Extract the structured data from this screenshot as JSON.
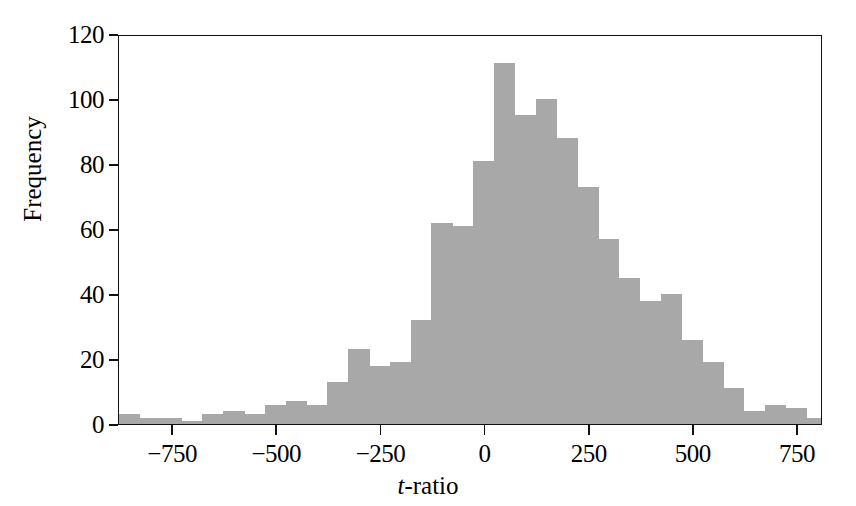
{
  "chart_data": {
    "type": "bar",
    "subtype": "histogram",
    "title": "",
    "xlabel": "t-ratio",
    "xlabel_italic_prefix": "t",
    "xlabel_rest": "-ratio",
    "ylabel": "Frequency",
    "xlim": [
      -880,
      810
    ],
    "ylim": [
      0,
      120
    ],
    "xticks": [
      -750,
      -500,
      -250,
      0,
      250,
      500,
      750
    ],
    "xtick_labels": [
      "−750",
      "−500",
      "−250",
      "0",
      "250",
      "500",
      "750"
    ],
    "yticks": [
      0,
      20,
      40,
      60,
      80,
      100,
      120
    ],
    "ytick_labels": [
      "0",
      "20",
      "40",
      "60",
      "80",
      "100",
      "120"
    ],
    "grid": false,
    "legend": null,
    "bin_width": 50,
    "bar_color": "#a8a8a8",
    "frame_color": "#111111",
    "bins": [
      {
        "x0": -880,
        "x1": -830,
        "center": -855,
        "value": 3
      },
      {
        "x0": -830,
        "x1": -780,
        "center": -805,
        "value": 2
      },
      {
        "x0": -780,
        "x1": -730,
        "center": -755,
        "value": 2
      },
      {
        "x0": -730,
        "x1": -680,
        "center": -705,
        "value": 1
      },
      {
        "x0": -680,
        "x1": -630,
        "center": -655,
        "value": 3
      },
      {
        "x0": -630,
        "x1": -580,
        "center": -605,
        "value": 4
      },
      {
        "x0": -580,
        "x1": -530,
        "center": -555,
        "value": 3
      },
      {
        "x0": -530,
        "x1": -480,
        "center": -505,
        "value": 6
      },
      {
        "x0": -480,
        "x1": -430,
        "center": -455,
        "value": 7
      },
      {
        "x0": -430,
        "x1": -380,
        "center": -405,
        "value": 6
      },
      {
        "x0": -380,
        "x1": -330,
        "center": -355,
        "value": 13
      },
      {
        "x0": -330,
        "x1": -280,
        "center": -305,
        "value": 23
      },
      {
        "x0": -280,
        "x1": -230,
        "center": -255,
        "value": 18
      },
      {
        "x0": -230,
        "x1": -180,
        "center": -205,
        "value": 19
      },
      {
        "x0": -180,
        "x1": -130,
        "center": -155,
        "value": 32
      },
      {
        "x0": -130,
        "x1": -80,
        "center": -105,
        "value": 62
      },
      {
        "x0": -80,
        "x1": -30,
        "center": -55,
        "value": 61
      },
      {
        "x0": -30,
        "x1": 20,
        "center": -5,
        "value": 81
      },
      {
        "x0": 20,
        "x1": 70,
        "center": 45,
        "value": 111
      },
      {
        "x0": 70,
        "x1": 120,
        "center": 95,
        "value": 95
      },
      {
        "x0": 120,
        "x1": 170,
        "center": 145,
        "value": 100
      },
      {
        "x0": 170,
        "x1": 220,
        "center": 195,
        "value": 88
      },
      {
        "x0": 220,
        "x1": 270,
        "center": 245,
        "value": 73
      },
      {
        "x0": 270,
        "x1": 320,
        "center": 295,
        "value": 57
      },
      {
        "x0": 320,
        "x1": 370,
        "center": 345,
        "value": 45
      },
      {
        "x0": 370,
        "x1": 420,
        "center": 395,
        "value": 38
      },
      {
        "x0": 420,
        "x1": 470,
        "center": 445,
        "value": 40
      },
      {
        "x0": 470,
        "x1": 520,
        "center": 495,
        "value": 26
      },
      {
        "x0": 520,
        "x1": 570,
        "center": 545,
        "value": 19
      },
      {
        "x0": 570,
        "x1": 620,
        "center": 595,
        "value": 11
      },
      {
        "x0": 620,
        "x1": 670,
        "center": 645,
        "value": 4
      },
      {
        "x0": 670,
        "x1": 720,
        "center": 695,
        "value": 6
      },
      {
        "x0": 720,
        "x1": 770,
        "center": 745,
        "value": 5
      },
      {
        "x0": 770,
        "x1": 810,
        "center": 790,
        "value": 2
      }
    ]
  }
}
